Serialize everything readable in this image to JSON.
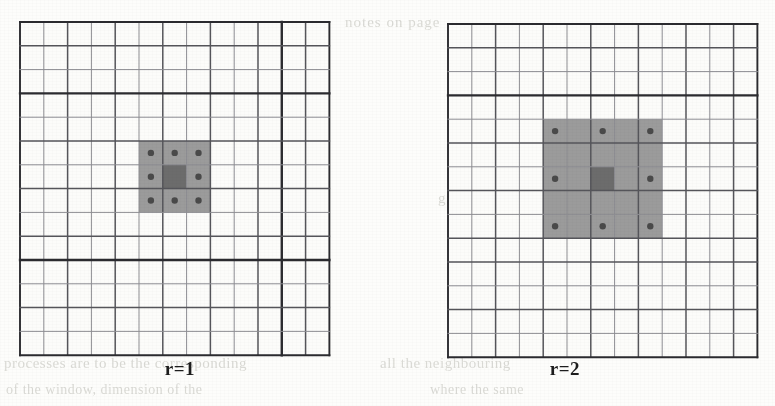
{
  "figure": {
    "background_color": "#fdfdfb",
    "grid_line_color": "#55555a",
    "grid_line_color_light": "#8d8d92",
    "grid_line_color_heavy": "#2b2b2f",
    "shade_color": "#9b9b9b",
    "center_color": "#6c6c6c",
    "dot_color": "#4a4a4a",
    "caption_color": "#1d1d1d"
  },
  "panels": [
    {
      "id": "r1",
      "caption": "r=1",
      "grid": {
        "x": 18,
        "y": 20,
        "cols": 13,
        "rows": 14,
        "cell": 23.8,
        "heavy_vlines": [
          11
        ],
        "heavy_hlines": [
          3,
          10
        ],
        "medium_vlines": [
          0,
          2,
          4,
          6,
          8,
          10,
          12,
          13
        ],
        "medium_hlines": [
          0,
          1,
          3,
          5,
          7,
          9,
          10,
          12,
          14
        ]
      },
      "neighborhood": {
        "radius": 1,
        "block_cols": 3,
        "block_rows": 3,
        "origin_col": 5,
        "origin_row": 5,
        "center_col": 6,
        "center_row": 6,
        "dots": [
          {
            "col": 5,
            "row": 5
          },
          {
            "col": 6,
            "row": 5
          },
          {
            "col": 7,
            "row": 5
          },
          {
            "col": 5,
            "row": 6
          },
          {
            "col": 7,
            "row": 6
          },
          {
            "col": 5,
            "row": 7
          },
          {
            "col": 6,
            "row": 7
          },
          {
            "col": 7,
            "row": 7
          }
        ],
        "dot_count": 8
      }
    },
    {
      "id": "r2",
      "caption": "r=2",
      "grid": {
        "x": 446,
        "y": 22,
        "cols": 13,
        "rows": 14,
        "cell": 23.8,
        "heavy_vlines": [],
        "heavy_hlines": [
          3
        ],
        "medium_vlines": [
          0,
          2,
          4,
          6,
          8,
          10,
          12,
          13
        ],
        "medium_hlines": [
          0,
          1,
          3,
          5,
          7,
          9,
          10,
          12,
          14
        ]
      },
      "neighborhood": {
        "radius": 2,
        "block_cols": 5,
        "block_rows": 5,
        "origin_col": 4,
        "origin_row": 4,
        "center_col": 6,
        "center_row": 6,
        "dots": [
          {
            "col": 4,
            "row": 4
          },
          {
            "col": 6,
            "row": 4
          },
          {
            "col": 8,
            "row": 4
          },
          {
            "col": 4,
            "row": 6
          },
          {
            "col": 8,
            "row": 6
          },
          {
            "col": 4,
            "row": 8
          },
          {
            "col": 6,
            "row": 8
          },
          {
            "col": 8,
            "row": 8
          }
        ],
        "dot_count": 8
      }
    }
  ],
  "bleed_text": {
    "line1": "notes on page",
    "line2": "grid structure",
    "line3": "processes are to be the corresponding",
    "line4": "all the neighbouring",
    "line5": "of the window, dimension of the",
    "line6": "where the same"
  }
}
